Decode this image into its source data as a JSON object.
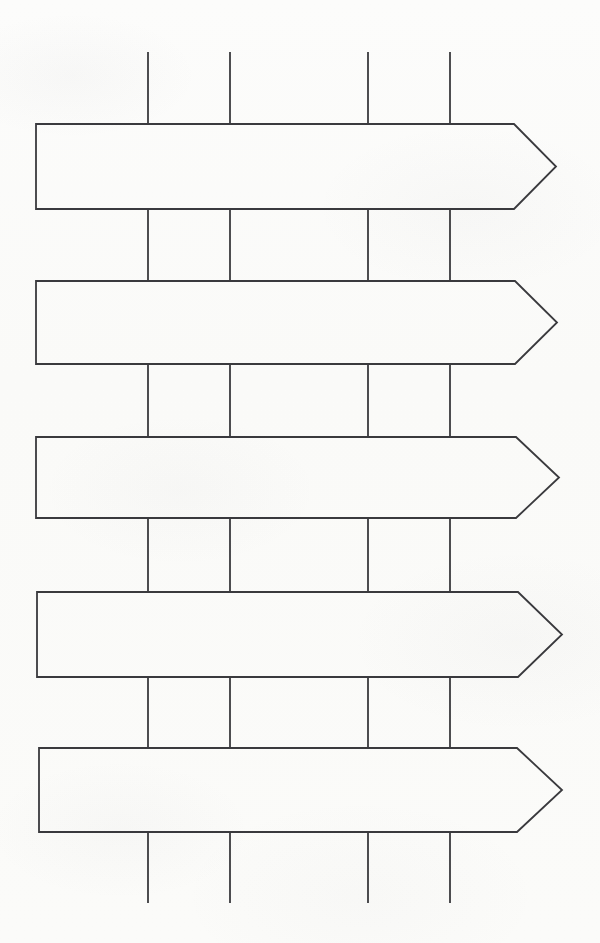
{
  "document": {
    "title": "Arrow Banner Template",
    "media": "scanned line drawing",
    "background_color": "#fdfdfc",
    "ink_color": "#3a3a3e",
    "width": 600,
    "height": 943
  },
  "canvas": {
    "width": 600,
    "height": 943
  },
  "diagram": {
    "kind": "arrow-ladder",
    "stroke_color": "#3a3a3e",
    "stroke_width": 1.8,
    "fill_color": "#ffffff",
    "arrow_count": 5,
    "connector_column_count": 4,
    "connector_columns_x": [
      148,
      230,
      368,
      450
    ],
    "arrows": [
      {
        "index": 1,
        "label": "arrow-1",
        "left_x": 36,
        "shoulder_x": 514,
        "tip_x": 556,
        "top_y": 124,
        "bottom_y": 209,
        "tip_y": 166.5
      },
      {
        "index": 2,
        "label": "arrow-2",
        "left_x": 36,
        "shoulder_x": 515,
        "tip_x": 557,
        "top_y": 281,
        "bottom_y": 364,
        "tip_y": 322.5
      },
      {
        "index": 3,
        "label": "arrow-3",
        "left_x": 36,
        "shoulder_x": 516,
        "tip_x": 559,
        "top_y": 437,
        "bottom_y": 518,
        "tip_y": 477.5
      },
      {
        "index": 4,
        "label": "arrow-4",
        "left_x": 37,
        "shoulder_x": 518,
        "tip_x": 562,
        "top_y": 592,
        "bottom_y": 677,
        "tip_y": 634.5
      },
      {
        "index": 5,
        "label": "arrow-5",
        "left_x": 39,
        "shoulder_x": 517,
        "tip_x": 562,
        "top_y": 748,
        "bottom_y": 832,
        "tip_y": 790
      }
    ],
    "connector_rows": [
      {
        "index": 0,
        "label": "connectors-top",
        "top_y": 52,
        "bottom_y": 124,
        "above_arrow": "arrow-1"
      },
      {
        "index": 1,
        "label": "connectors-between-1-2",
        "top_y": 209,
        "bottom_y": 281,
        "above_arrow": "arrow-2"
      },
      {
        "index": 2,
        "label": "connectors-between-2-3",
        "top_y": 364,
        "bottom_y": 437,
        "above_arrow": "arrow-3"
      },
      {
        "index": 3,
        "label": "connectors-between-3-4",
        "top_y": 518,
        "bottom_y": 592,
        "above_arrow": "arrow-4"
      },
      {
        "index": 4,
        "label": "connectors-between-4-5",
        "top_y": 677,
        "bottom_y": 748,
        "above_arrow": "arrow-5"
      },
      {
        "index": 5,
        "label": "connectors-bottom",
        "top_y": 832,
        "bottom_y": 903,
        "above_arrow": null
      }
    ]
  }
}
